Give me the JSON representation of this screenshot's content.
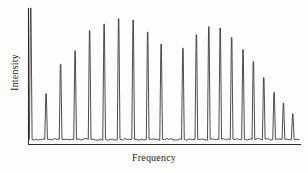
{
  "figure": {
    "xlabel": "Frequency",
    "ylabel": "Intensity",
    "line_color": "#3a3a3a",
    "axis_color": "#2b2b2b",
    "background": "#fdfdfc"
  },
  "chart_data": {
    "type": "line",
    "title": "",
    "subtitle": "",
    "xlabel": "Frequency",
    "ylabel": "Intensity",
    "xlim": [
      0,
      100
    ],
    "ylim": [
      0,
      100
    ],
    "grid": false,
    "legend": null,
    "tick_labels": {
      "x": [],
      "y": []
    },
    "baseline": 2,
    "peaks": [
      {
        "x": 0.6,
        "height": 100.0,
        "label": "line-1",
        "branch": "P",
        "clipped": true
      },
      {
        "x": 8.0,
        "height": 36.0,
        "label": "line-2",
        "branch": "P",
        "clipped": false
      },
      {
        "x": 15.0,
        "height": 58.0,
        "label": "line-3",
        "branch": "P",
        "clipped": false
      },
      {
        "x": 22.0,
        "height": 68.0,
        "label": "line-4",
        "branch": "P",
        "clipped": false
      },
      {
        "x": 29.0,
        "height": 83.0,
        "label": "line-5",
        "branch": "P",
        "clipped": false
      },
      {
        "x": 36.0,
        "height": 88.0,
        "label": "line-6",
        "branch": "P",
        "clipped": false
      },
      {
        "x": 43.0,
        "height": 92.0,
        "label": "line-7",
        "branch": "P",
        "clipped": false
      },
      {
        "x": 50.0,
        "height": 91.0,
        "label": "line-8",
        "branch": "P",
        "clipped": false
      },
      {
        "x": 57.0,
        "height": 82.0,
        "label": "line-9",
        "branch": "P",
        "clipped": false
      },
      {
        "x": 63.5,
        "height": 73.0,
        "label": "line-10",
        "branch": "P",
        "clipped": false
      },
      {
        "x": 74.0,
        "height": 70.0,
        "label": "line-11",
        "branch": "R",
        "clipped": false
      },
      {
        "x": 80.5,
        "height": 80.0,
        "label": "line-12",
        "branch": "R",
        "clipped": false
      },
      {
        "x": 86.5,
        "height": 86.0,
        "label": "line-13",
        "branch": "R",
        "clipped": false
      },
      {
        "x": 92.0,
        "height": 85.0,
        "label": "line-14",
        "branch": "R",
        "clipped": false
      },
      {
        "x": 97.5,
        "height": 78.0,
        "label": "line-15",
        "branch": "R",
        "clipped": false
      },
      {
        "x": 103.0,
        "height": 69.0,
        "label": "line-16",
        "branch": "R",
        "clipped": false
      },
      {
        "x": 108.0,
        "height": 60.0,
        "label": "line-17",
        "branch": "R",
        "clipped": false
      },
      {
        "x": 113.0,
        "height": 48.0,
        "label": "line-18",
        "branch": "R",
        "clipped": false
      },
      {
        "x": 118.0,
        "height": 37.0,
        "label": "line-19",
        "branch": "R",
        "clipped": false
      },
      {
        "x": 122.5,
        "height": 29.0,
        "label": "line-20",
        "branch": "R",
        "clipped": false
      },
      {
        "x": 127.0,
        "height": 21.0,
        "label": "line-21",
        "branch": "R",
        "clipped": false
      }
    ],
    "gap": {
      "start": 64.5,
      "end": 73.0,
      "note": "missing Q branch / band centre"
    }
  }
}
